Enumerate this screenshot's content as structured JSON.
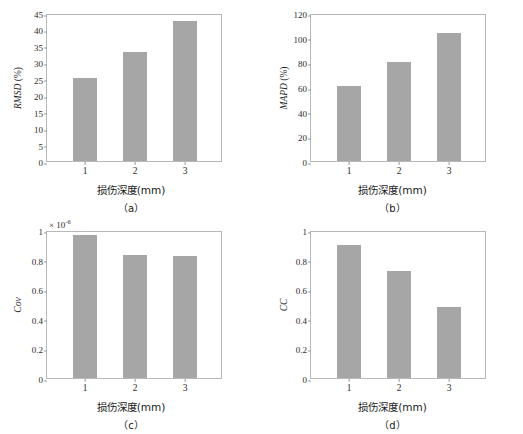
{
  "figure": {
    "background": "#ffffff",
    "bar_color": "#a6a6a6",
    "axis_color": "#b9b9b9"
  },
  "chart_data": [
    {
      "id": "a",
      "type": "bar",
      "title": "",
      "caption": "（a）",
      "xlabel": "损伤深度(mm)",
      "ylabel": "RMSD",
      "yunit": "(%)",
      "categories": [
        "1",
        "2",
        "3"
      ],
      "values": [
        25.2,
        33.0,
        42.6
      ],
      "ylim": [
        0,
        45
      ],
      "yticks": [
        "0",
        "5",
        "10",
        "15",
        "20",
        "25",
        "30",
        "35",
        "40",
        "45"
      ],
      "ytickvals": [
        0,
        5,
        10,
        15,
        20,
        25,
        30,
        35,
        40,
        45
      ],
      "grid": false,
      "legend": "none",
      "exponent": ""
    },
    {
      "id": "b",
      "type": "bar",
      "title": "",
      "caption": "（b）",
      "xlabel": "损伤深度(mm)",
      "ylabel": "MAPD",
      "yunit": "(%)",
      "categories": [
        "1",
        "2",
        "3"
      ],
      "values": [
        61,
        80,
        103.5
      ],
      "ylim": [
        0,
        120
      ],
      "yticks": [
        "0",
        "20",
        "40",
        "60",
        "80",
        "100",
        "120"
      ],
      "ytickvals": [
        0,
        20,
        40,
        60,
        80,
        100,
        120
      ],
      "grid": false,
      "legend": "none",
      "exponent": ""
    },
    {
      "id": "c",
      "type": "bar",
      "title": "",
      "caption": "（c）",
      "xlabel": "损伤深度(mm)",
      "ylabel": "Cov",
      "yunit": "",
      "categories": [
        "1",
        "2",
        "3"
      ],
      "values": [
        0.965,
        0.83,
        0.825
      ],
      "ylim": [
        0,
        1
      ],
      "yticks": [
        "0",
        "0.2",
        "0.4",
        "0.6",
        "0.8",
        "1"
      ],
      "ytickvals": [
        0,
        0.2,
        0.4,
        0.6,
        0.8,
        1
      ],
      "grid": false,
      "legend": "none",
      "exponent": "× 10",
      "exponent_power": "-6"
    },
    {
      "id": "d",
      "type": "bar",
      "title": "",
      "caption": "（d）",
      "xlabel": "损伤深度(mm)",
      "ylabel": "CC",
      "yunit": "",
      "categories": [
        "1",
        "2",
        "3"
      ],
      "values": [
        0.9,
        0.725,
        0.48
      ],
      "ylim": [
        0,
        1
      ],
      "yticks": [
        "0",
        "0.2",
        "0.4",
        "0.6",
        "0.8",
        "1"
      ],
      "ytickvals": [
        0,
        0.2,
        0.4,
        0.6,
        0.8,
        1
      ],
      "grid": false,
      "legend": "none",
      "exponent": ""
    }
  ]
}
